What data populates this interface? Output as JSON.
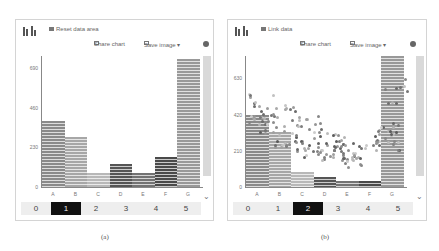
{
  "panels": [
    {
      "id": "a",
      "top_link": "Reset data area",
      "toolbar": {
        "share": "Share chart",
        "save": "Save image ▾"
      },
      "slider": {
        "options": [
          "0",
          "1",
          "2",
          "3",
          "4",
          "5"
        ],
        "selected": 1
      },
      "caption": "(a)"
    },
    {
      "id": "b",
      "top_link": "Link data",
      "toolbar": {
        "share": "Share chart",
        "save": "Save image ▾"
      },
      "slider": {
        "options": [
          "0",
          "1",
          "2",
          "3",
          "4",
          "5"
        ],
        "selected": 2
      },
      "caption": "(b)"
    }
  ],
  "chart_data": [
    {
      "type": "bar",
      "title": "",
      "categories": [
        "A",
        "B",
        "C",
        "D",
        "E",
        "F",
        "G"
      ],
      "values": [
        385,
        290,
        80,
        135,
        80,
        175,
        740
      ],
      "yticks": [
        0,
        230,
        460,
        690
      ],
      "ylim": [
        0,
        760
      ],
      "colors": [
        "#8a8a8a",
        "#a7a7a7",
        "#b8b8b8",
        "#555555",
        "#737373",
        "#4a4a4a",
        "#999999"
      ]
    },
    {
      "type": "bar+scatter",
      "title": "",
      "categories": [
        "A",
        "B",
        "C",
        "D",
        "E",
        "F",
        "G"
      ],
      "values": [
        420,
        320,
        90,
        60,
        35,
        35,
        760
      ],
      "yticks": [
        0,
        210,
        420,
        630
      ],
      "ylim": [
        0,
        760
      ],
      "colors": [
        "#8a8a8a",
        "#a7a7a7",
        "#b8b8b8",
        "#555555",
        "#737373",
        "#4a4a4a",
        "#999999"
      ],
      "scatter_note": "points clustered descending from B to E, rising toward F/G"
    }
  ]
}
